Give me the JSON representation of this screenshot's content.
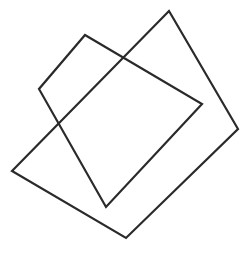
{
  "diagram": {
    "background": "#ffffff",
    "stroke_color": "#2a2a2a",
    "stroke_width": 2.2,
    "shapes": [
      {
        "name": "square-a",
        "type": "square-outline",
        "points": [
          [
            169,
            11
          ],
          [
            238,
            129
          ],
          [
            126,
            238
          ],
          [
            12,
            171
          ]
        ]
      },
      {
        "name": "square-b",
        "type": "square-outline",
        "points": [
          [
            85,
            35
          ],
          [
            202,
            104
          ],
          [
            106,
            207
          ],
          [
            39,
            89
          ]
        ]
      }
    ]
  }
}
